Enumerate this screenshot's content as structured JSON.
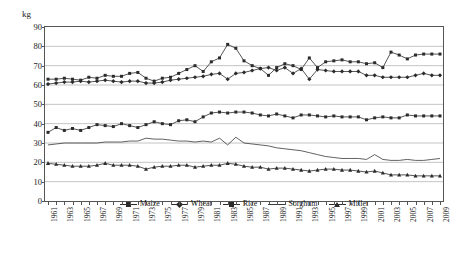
{
  "chart_data": {
    "type": "line",
    "title": "",
    "xlabel": "",
    "ylabel": "kg",
    "unit_label": "kg",
    "ylim": [
      0,
      90
    ],
    "ytick_step": 10,
    "yticks": [
      "0",
      "10",
      "20",
      "30",
      "40",
      "50",
      "60",
      "70",
      "80",
      "90"
    ],
    "grid": true,
    "legend_position": "bottom-center",
    "x_start": 1961,
    "x_end": 2009,
    "x_label_step": 2,
    "x": [
      1961,
      1962,
      1963,
      1964,
      1965,
      1966,
      1967,
      1968,
      1969,
      1970,
      1971,
      1972,
      1973,
      1974,
      1975,
      1976,
      1977,
      1978,
      1979,
      1980,
      1981,
      1982,
      1983,
      1984,
      1985,
      1986,
      1987,
      1988,
      1989,
      1990,
      1991,
      1992,
      1993,
      1994,
      1995,
      1996,
      1997,
      1998,
      1999,
      2000,
      2001,
      2002,
      2003,
      2004,
      2005,
      2006,
      2007,
      2008,
      2009
    ],
    "xticks": [
      "1961",
      "1963",
      "1965",
      "1967",
      "1969",
      "1971",
      "1973",
      "1975",
      "1977",
      "1979",
      "1981",
      "1983",
      "1985",
      "1987",
      "1989",
      "1991",
      "1993",
      "1995",
      "1997",
      "1999",
      "2001",
      "2003",
      "2005",
      "2007",
      "2009"
    ],
    "series": [
      {
        "name": "Maize",
        "marker": "square",
        "color": "#2b2b2b",
        "values": [
          63.0,
          63.0,
          63.5,
          63.0,
          62.5,
          64.0,
          63.5,
          65.0,
          64.5,
          64.5,
          66.0,
          66.5,
          63.5,
          62.0,
          63.5,
          64.0,
          66.0,
          68.0,
          70.0,
          67.0,
          72.0,
          74.0,
          81.0,
          79.0,
          72.5,
          70.0,
          68.5,
          65.0,
          69.0,
          71.0,
          70.0,
          68.0,
          74.0,
          69.0,
          72.0,
          72.5,
          73.0,
          72.0,
          72.0,
          71.0,
          71.5,
          69.0,
          77.0,
          75.5,
          73.5,
          75.5,
          76.0,
          76.0,
          76.0
        ]
      },
      {
        "name": "Wheat",
        "marker": "diamond",
        "color": "#2b2b2b",
        "values": [
          60.5,
          61.0,
          61.5,
          61.5,
          62.0,
          61.5,
          62.0,
          62.5,
          62.0,
          61.5,
          62.0,
          62.0,
          61.0,
          61.0,
          61.5,
          62.5,
          63.0,
          63.5,
          64.0,
          64.5,
          65.5,
          66.0,
          63.0,
          66.0,
          66.5,
          67.5,
          68.5,
          69.0,
          67.5,
          69.0,
          66.0,
          68.5,
          63.0,
          68.0,
          67.5,
          67.0,
          67.0,
          67.0,
          67.0,
          65.0,
          65.0,
          64.0,
          64.0,
          64.0,
          64.0,
          65.0,
          66.0,
          65.0,
          65.0
        ]
      },
      {
        "name": "Rice",
        "marker": "square",
        "color": "#2b2b2b",
        "values": [
          35.5,
          38.0,
          36.5,
          37.5,
          36.5,
          38.0,
          39.5,
          39.0,
          38.5,
          40.0,
          39.0,
          38.0,
          39.5,
          41.0,
          40.0,
          39.5,
          41.5,
          42.0,
          41.0,
          43.5,
          45.5,
          46.0,
          45.5,
          46.0,
          46.0,
          45.5,
          44.5,
          44.0,
          45.0,
          44.0,
          43.0,
          44.5,
          44.5,
          44.0,
          43.5,
          44.0,
          43.5,
          43.5,
          43.5,
          42.0,
          43.0,
          43.5,
          43.0,
          43.0,
          44.5,
          44.0,
          44.0,
          44.0,
          44.0
        ]
      },
      {
        "name": "Sorghum",
        "marker": "none",
        "color": "#3a3a3a",
        "values": [
          29.0,
          29.5,
          30.0,
          30.0,
          30.0,
          30.0,
          30.0,
          30.5,
          30.5,
          30.5,
          31.0,
          31.0,
          32.5,
          32.0,
          32.0,
          31.5,
          31.0,
          31.0,
          30.5,
          31.0,
          30.5,
          32.5,
          29.0,
          33.0,
          30.0,
          29.5,
          29.0,
          28.5,
          27.5,
          27.0,
          26.5,
          26.0,
          25.0,
          24.0,
          23.0,
          22.5,
          22.0,
          22.0,
          22.0,
          21.5,
          24.0,
          21.5,
          21.0,
          21.0,
          21.5,
          21.0,
          21.0,
          21.5,
          22.0
        ]
      },
      {
        "name": "Millet",
        "marker": "triangle",
        "color": "#2b2b2b",
        "values": [
          19.5,
          19.0,
          18.5,
          18.0,
          18.0,
          18.0,
          18.5,
          19.5,
          18.5,
          18.5,
          18.5,
          18.0,
          16.5,
          17.5,
          18.0,
          18.0,
          18.5,
          18.5,
          17.5,
          18.0,
          18.5,
          18.5,
          19.5,
          19.0,
          18.0,
          17.5,
          17.5,
          16.5,
          17.0,
          17.0,
          16.5,
          16.0,
          15.5,
          16.0,
          16.5,
          16.5,
          16.0,
          16.0,
          15.5,
          15.0,
          15.5,
          14.5,
          13.5,
          13.5,
          13.5,
          13.0,
          13.0,
          13.0,
          13.0
        ]
      }
    ]
  }
}
